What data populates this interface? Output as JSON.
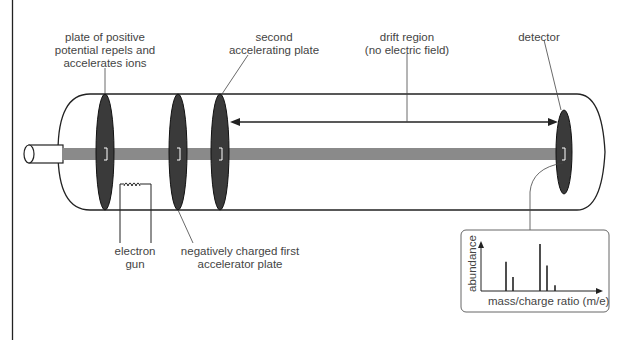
{
  "diagram": {
    "labels": {
      "positive_plate": [
        "plate of positive",
        "potential repels and",
        "accelerates ions"
      ],
      "second_plate": [
        "second",
        "accelerating plate"
      ],
      "drift_region": [
        "drift region",
        "(no electric field)"
      ],
      "detector": [
        "detector"
      ],
      "electron_gun": [
        "electron",
        "gun"
      ],
      "first_plate": [
        "negatively charged first",
        "accelerator plate"
      ]
    },
    "inset": {
      "y_label": "abundance",
      "x_label": "mass/charge ratio (m/e)"
    },
    "colors": {
      "plate": "#3a3a3a",
      "beam": "#8a8a8a",
      "outline": "#222222",
      "text": "#444444"
    }
  },
  "chart_data": {
    "type": "bar",
    "title": "",
    "xlabel": "mass/charge ratio (m/e)",
    "ylabel": "abundance",
    "note": "schematic spectrum, unlabeled ticks; relative heights",
    "x": [
      1,
      2,
      3,
      4,
      5
    ],
    "values": [
      0.62,
      0.3,
      1.0,
      0.54,
      0.12
    ]
  }
}
